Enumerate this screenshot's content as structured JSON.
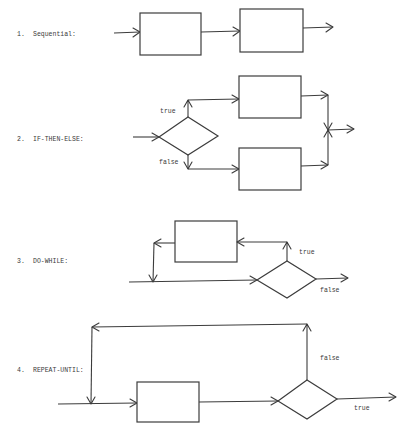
{
  "sections": [
    {
      "number": "1.",
      "name": "Sequential:"
    },
    {
      "number": "2.",
      "name": "IF-THEN-ELSE:",
      "branch_true": "true",
      "branch_false": "false"
    },
    {
      "number": "3.",
      "name": "DO-WHILE:",
      "branch_true": "true",
      "branch_false": "false"
    },
    {
      "number": "4.",
      "name": "REPEAT-UNTIL:",
      "branch_true": "true",
      "branch_false": "false"
    }
  ]
}
